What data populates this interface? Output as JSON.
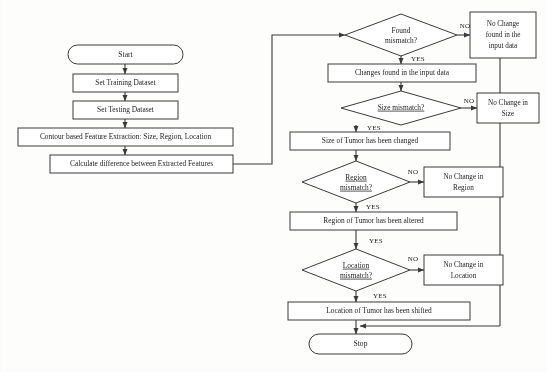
{
  "diagram": {
    "colors": {
      "background": "#fdfdfc",
      "stroke": "#3a3a3a",
      "shape_fill": "#ffffff",
      "text": "#1c1c1c"
    },
    "nodes": {
      "start": {
        "label": "Start",
        "type": "terminator"
      },
      "set_training": {
        "label": "Set Training Dataset",
        "type": "process"
      },
      "set_testing": {
        "label": "Set Testing Dataset",
        "type": "process"
      },
      "feature_extraction": {
        "label": "Contour based Feature Extraction: Size, Region, Location",
        "type": "process"
      },
      "calculate_difference": {
        "label": "Calculate difference between Extracted Features",
        "type": "process"
      },
      "found_mismatch": {
        "label_line1": "Found",
        "label_line2": "mismatch?",
        "type": "decision"
      },
      "no_change_input": {
        "label_line1": "No Change",
        "label_line2": "found in the",
        "label_line3": "input data",
        "type": "process"
      },
      "changes_found": {
        "label": "Changes found in the input data",
        "type": "process"
      },
      "size_mismatch": {
        "label": "Size mismatch?",
        "type": "decision"
      },
      "no_change_size": {
        "label_line1": "No Change in",
        "label_line2": "Size",
        "type": "process"
      },
      "size_changed": {
        "label": "Size of Tumor has been changed",
        "type": "process"
      },
      "region_mismatch": {
        "label_line1": "Region",
        "label_line2": "mismatch?",
        "type": "decision"
      },
      "no_change_region": {
        "label_line1": "No Change in",
        "label_line2": "Region",
        "type": "process"
      },
      "region_altered": {
        "label": "Region of Tumor has been altered",
        "type": "process"
      },
      "location_mismatch": {
        "label_line1": "Location",
        "label_line2": "mismatch?",
        "type": "decision"
      },
      "no_change_location": {
        "label_line1": "No Change in",
        "label_line2": "Location",
        "type": "process"
      },
      "location_shifted": {
        "label": "Location of Tumor has been shifted",
        "type": "process"
      },
      "stop": {
        "label": "Stop",
        "type": "terminator"
      }
    },
    "edge_labels": {
      "found_no": "NO",
      "found_yes": "YES",
      "size_no": "NO",
      "size_yes": "YES",
      "region_no": "NO",
      "region_yes": "YES",
      "region_to_location_yes": "YES",
      "location_no": "NO",
      "location_yes": "YES"
    }
  }
}
